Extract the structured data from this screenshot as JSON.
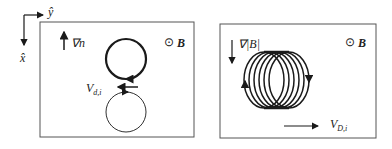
{
  "axes": {
    "y_label": "ŷ",
    "x_label": "x̂"
  },
  "left_panel": {
    "gradient_label": "∇n",
    "field_symbol": "⊙",
    "field_label": "B",
    "drift_label_main": "V",
    "drift_label_sub": "d,i"
  },
  "right_panel": {
    "gradient_label": "∇|B|",
    "field_symbol": "⊙",
    "field_label": "B",
    "drift_label_main": "V",
    "drift_label_sub": "D,i"
  },
  "colors": {
    "stroke": "#1a1a1a",
    "frame": "#555555"
  }
}
